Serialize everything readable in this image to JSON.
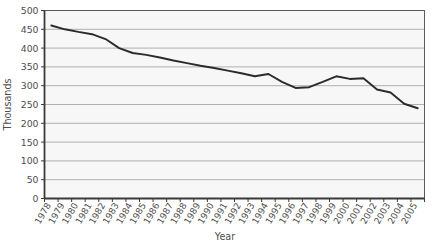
{
  "chart_data": {
    "type": "line",
    "title": "",
    "xlabel": "Year",
    "ylabel": "Thousands",
    "categories": [
      "1978",
      "1979",
      "1980",
      "1981",
      "1982",
      "1983",
      "1984",
      "1985",
      "1986",
      "1987",
      "1988",
      "1989",
      "1990",
      "1991",
      "1992",
      "1993",
      "1994",
      "1995",
      "1996",
      "1997",
      "1998",
      "1999",
      "2000",
      "2001",
      "2002",
      "2003",
      "2004",
      "2005"
    ],
    "values": [
      460,
      450,
      443,
      437,
      424,
      400,
      387,
      382,
      375,
      367,
      360,
      353,
      347,
      340,
      333,
      325,
      331,
      310,
      294,
      296,
      310,
      325,
      318,
      320,
      290,
      282,
      252,
      240
    ],
    "ylim": [
      0,
      500
    ],
    "yticks": [
      0,
      50,
      100,
      150,
      200,
      250,
      300,
      350,
      400,
      450,
      500
    ],
    "ytick_labels": [
      "0",
      "50",
      "100",
      "150",
      "200",
      "250",
      "300",
      "350",
      "400",
      "450",
      "500"
    ],
    "grid": true,
    "grid_axis": "y",
    "legend": false,
    "series": [
      {
        "name": "series-1",
        "color": "#2b2b2b",
        "values": [
          460,
          450,
          443,
          437,
          424,
          400,
          387,
          382,
          375,
          367,
          360,
          353,
          347,
          340,
          333,
          325,
          331,
          310,
          294,
          296,
          310,
          325,
          318,
          320,
          290,
          282,
          252,
          240
        ]
      }
    ],
    "colors": {
      "line": "#2b2b2b",
      "grid": "#b0b0b0",
      "plot_background": "#f7f7f7",
      "plot_border": "#5a5a5a",
      "axis": "#3a3a3a",
      "text": "#4d4d4d"
    }
  }
}
